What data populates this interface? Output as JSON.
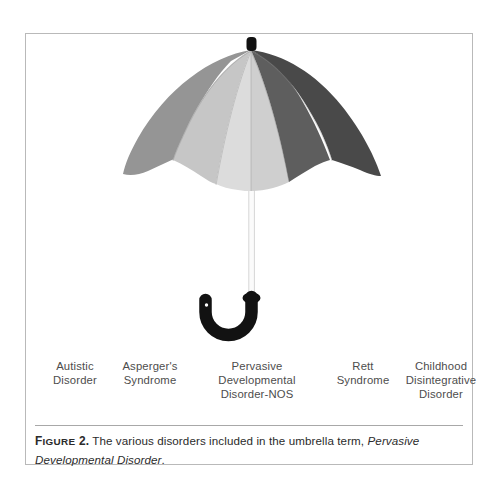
{
  "figure": {
    "illustration": {
      "name": "umbrella-illustration",
      "alt": "Open umbrella with six visible canopy panels shaded from light to dark grey, a straight shaft and a J-shaped hook handle",
      "finial_color": "#111111",
      "shaft_color": "#fbfbfb",
      "shaft_outline_color": "#d3d3d3",
      "handle_color": "#121212",
      "panel_colors": [
        "#959595",
        "#c6c6c6",
        "#dcdcdc",
        "#cfcfcf",
        "#5e5e5e",
        "#494949"
      ],
      "panel_seam_color": "#8f8f8f"
    },
    "labels": [
      {
        "id": "autistic-disorder",
        "text": "Autistic\nDisorder"
      },
      {
        "id": "aspergers-syndrome",
        "text": "Asperger's\nSyndrome"
      },
      {
        "id": "pdd-nos",
        "text": "Pervasive\nDevelopmental\nDisorder-NOS"
      },
      {
        "id": "rett-syndrome",
        "text": "Rett\nSyndrome"
      },
      {
        "id": "childhood-disintegrative-disorder",
        "text": "Childhood\nDisintegrative\nDisorder"
      }
    ],
    "caption": {
      "figure_word": "Figure",
      "figure_number": "2.",
      "body_before_term": " The various disorders included in the umbrella term, ",
      "term_italic": "Pervasive Developmental Disorder",
      "body_after_term": "."
    },
    "colors": {
      "frame_border": "#b9b9b9",
      "divider": "#a8a8a8",
      "label_text": "#4d4d4d",
      "caption_text": "#2b2b2b",
      "page_background": "#ffffff"
    }
  }
}
